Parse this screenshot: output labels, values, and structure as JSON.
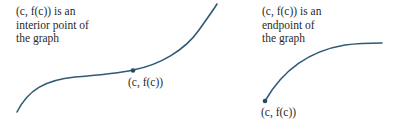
{
  "colors": {
    "curve": "#2f5a78",
    "point": "#244a66",
    "text": "#2a2a2a",
    "background": "#ffffff"
  },
  "panels": [
    {
      "id": "interior",
      "caption_lines": [
        "(c, f(c)) is an",
        "interior point of",
        "the graph"
      ],
      "point_label": "(c, f(c))",
      "curve_description": "S-shaped increasing curve with marked point in its interior"
    },
    {
      "id": "endpoint",
      "caption_lines": [
        "(c, f(c)) is an",
        "endpoint of",
        "the graph"
      ],
      "point_label": "(c, f(c))",
      "curve_description": "Concave-down increasing curve starting at the marked endpoint"
    }
  ]
}
